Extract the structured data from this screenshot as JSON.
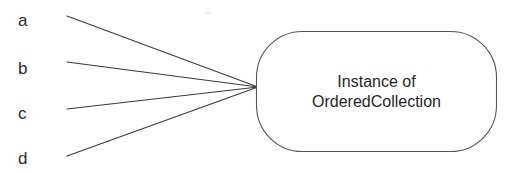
{
  "diagram": {
    "type": "object-reference-diagram",
    "canvas": {
      "width": 511,
      "height": 173,
      "background": "#ffffff"
    },
    "line_color": "#3a3a3a",
    "node_border_color": "#555555",
    "text_color": "#1f1f1f",
    "variables": [
      {
        "label": "a",
        "label_x": 18,
        "label_baseline_y": 25,
        "line_start_x": 67,
        "line_start_y": 16
      },
      {
        "label": "b",
        "label_x": 18,
        "label_baseline_y": 73,
        "line_start_x": 67,
        "line_start_y": 62
      },
      {
        "label": "c",
        "label_x": 18,
        "label_baseline_y": 118,
        "line_start_x": 67,
        "line_start_y": 109
      },
      {
        "label": "d",
        "label_x": 18,
        "label_baseline_y": 163,
        "line_start_x": 67,
        "line_start_y": 156
      }
    ],
    "convergence_point": {
      "x": 258,
      "y": 87
    },
    "node": {
      "shape": "rounded-rectangle",
      "x": 256,
      "y": 31,
      "width": 241,
      "height": 121,
      "corner_radius": 46,
      "text_lines": [
        "Instance of",
        "OrderedCollection"
      ]
    }
  }
}
